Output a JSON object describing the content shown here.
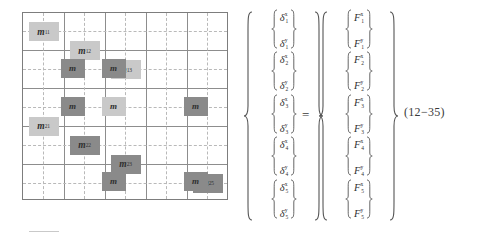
{
  "equation": {
    "number": "(12−35)",
    "equals_symbol": "=",
    "matrix": {
      "rows": 5,
      "cols": 5,
      "grid_border_color": "#7d7d7d",
      "gridline_color": "#8d8d8d",
      "dashed_guide_color": "#b9b9b9",
      "highlight_light_color": "#c9c9c9",
      "highlight_dark_color": "#8a8a8a",
      "cells": [
        {
          "row": 1,
          "col": 1,
          "label": "m",
          "sub": "11",
          "highlight": "light"
        },
        {
          "row": 1,
          "col": 2,
          "label": "m",
          "sub": "12",
          "highlight": "light"
        },
        {
          "row": 1,
          "col": 3,
          "label": "m",
          "sub": "13",
          "highlight": "light"
        },
        {
          "row": 1,
          "col": 4,
          "label": "",
          "sub": "",
          "highlight": "none"
        },
        {
          "row": 1,
          "col": 5,
          "label": "",
          "sub": "",
          "highlight": "none"
        },
        {
          "row": 2,
          "col": 1,
          "label": "m",
          "sub": "21",
          "highlight": "light"
        },
        {
          "row": 2,
          "col": 2,
          "label": "m",
          "sub": "22",
          "highlight": "dark",
          "ghost": "m"
        },
        {
          "row": 2,
          "col": 3,
          "label": "m",
          "sub": "23",
          "highlight": "dark",
          "ghost": "m"
        },
        {
          "row": 2,
          "col": 4,
          "label": "",
          "sub": "",
          "highlight": "none"
        },
        {
          "row": 2,
          "col": 5,
          "label": "m",
          "sub": "25",
          "highlight": "dark"
        },
        {
          "row": 3,
          "col": 1,
          "label": "m",
          "sub": "31",
          "highlight": "light"
        },
        {
          "row": 3,
          "col": 2,
          "label": "m",
          "sub": "32",
          "highlight": "dark",
          "ghost": "m"
        },
        {
          "row": 3,
          "col": 3,
          "label": "m",
          "sub": "33",
          "highlight": "light",
          "ghost": "m"
        },
        {
          "row": 3,
          "col": 4,
          "label": "m",
          "sub": "34",
          "highlight": "light"
        },
        {
          "row": 3,
          "col": 5,
          "label": "m",
          "sub": "35",
          "highlight": "dark",
          "ghost": "m"
        },
        {
          "row": 4,
          "col": 1,
          "label": "",
          "sub": "",
          "highlight": "none"
        },
        {
          "row": 4,
          "col": 2,
          "label": "",
          "sub": "",
          "highlight": "none"
        },
        {
          "row": 4,
          "col": 3,
          "label": "m",
          "sub": "43",
          "highlight": "light"
        },
        {
          "row": 4,
          "col": 4,
          "label": "m",
          "sub": "44",
          "highlight": "light"
        },
        {
          "row": 4,
          "col": 5,
          "label": "m",
          "sub": "45",
          "highlight": "light"
        },
        {
          "row": 5,
          "col": 1,
          "label": "",
          "sub": "",
          "highlight": "none"
        },
        {
          "row": 5,
          "col": 2,
          "label": "m",
          "sub": "52",
          "highlight": "dark"
        },
        {
          "row": 5,
          "col": 3,
          "label": "m",
          "sub": "53",
          "highlight": "dark",
          "ghost": "m"
        },
        {
          "row": 5,
          "col": 4,
          "label": "m",
          "sub": "54",
          "highlight": "light"
        },
        {
          "row": 5,
          "col": 5,
          "label": "m",
          "sub": "55",
          "highlight": "dark",
          "ghost": "m"
        }
      ]
    },
    "displacement_vector": {
      "symbol": "δ",
      "groups": [
        {
          "index": "1",
          "x": "δ",
          "x_sup": "x",
          "x_sub": "1",
          "y": "δ",
          "y_sup": "y",
          "y_sub": "1"
        },
        {
          "index": "2",
          "x": "δ",
          "x_sup": "x",
          "x_sub": "2",
          "y": "δ",
          "y_sup": "y",
          "y_sub": "2"
        },
        {
          "index": "3",
          "x": "δ",
          "x_sup": "x",
          "x_sub": "3",
          "y": "δ",
          "y_sup": "y",
          "y_sub": "3"
        },
        {
          "index": "4",
          "x": "δ",
          "x_sup": "x",
          "x_sub": "4",
          "y": "δ",
          "y_sup": "y",
          "y_sub": "4"
        },
        {
          "index": "5",
          "x": "δ",
          "x_sup": "x",
          "x_sub": "5",
          "y": "δ",
          "y_sup": "y",
          "y_sub": "5"
        }
      ]
    },
    "force_vector": {
      "symbol": "F",
      "groups": [
        {
          "index": "1",
          "x": "F",
          "x_sup": "x",
          "x_sub": "1",
          "y": "F",
          "y_sup": "y",
          "y_sub": "1"
        },
        {
          "index": "2",
          "x": "F",
          "x_sup": "x",
          "x_sub": "2",
          "y": "F",
          "y_sup": "y",
          "y_sub": "2"
        },
        {
          "index": "3",
          "x": "F",
          "x_sup": "x",
          "x_sub": "3",
          "y": "F",
          "y_sup": "y",
          "y_sub": "3"
        },
        {
          "index": "4",
          "x": "F",
          "x_sup": "x",
          "x_sub": "4",
          "y": "F",
          "y_sup": "y",
          "y_sub": "4"
        },
        {
          "index": "5",
          "x": "F",
          "x_sup": "x",
          "x_sub": "5",
          "y": "F",
          "y_sup": "y",
          "y_sub": "5"
        }
      ]
    }
  }
}
